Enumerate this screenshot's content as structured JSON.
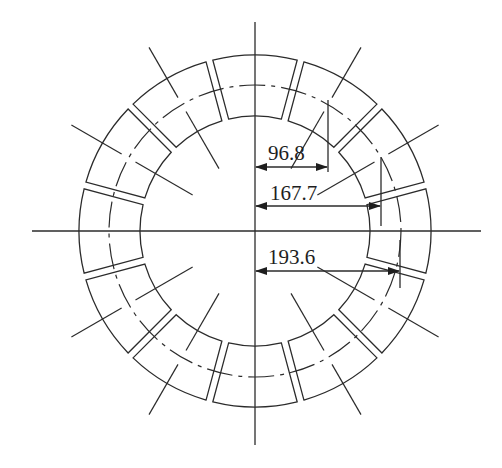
{
  "diagram": {
    "title": "",
    "segment_count": 12,
    "colors": {
      "line": "#2b2b2b",
      "text": "#1e1e1e",
      "background": "#ffffff"
    },
    "dimensions": [
      {
        "id": "dim-96-8",
        "label": "96.8",
        "target": "centerline-radius-60deg-horizontal-offset"
      },
      {
        "id": "dim-167-7",
        "label": "167.7",
        "target": "centerline-radius-30deg-horizontal-offset"
      },
      {
        "id": "dim-193-6",
        "label": "193.6",
        "target": "centerline-radius-minus30deg-extended"
      }
    ]
  }
}
